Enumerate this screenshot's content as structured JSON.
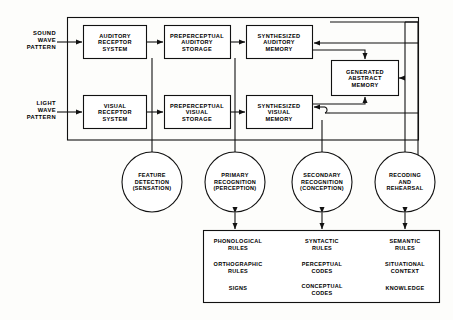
{
  "diagram": {
    "inputs": [
      {
        "name": "sound-wave-pattern",
        "label": "SOUND\nWAVE\nPATTERN"
      },
      {
        "name": "light-wave-pattern",
        "label": "LIGHT\nWAVE\nPATTERN"
      }
    ],
    "boxes": [
      {
        "name": "auditory-receptor-system",
        "label": "AUDITORY\nRECEPTOR\nSYSTEM"
      },
      {
        "name": "preperceptual-auditory-storage",
        "label": "PREPERCEPTUAL\nAUDITORY\nSTORAGE"
      },
      {
        "name": "synthesized-auditory-memory",
        "label": "SYNTHESIZED\nAUDITORY\nMEMORY"
      },
      {
        "name": "generated-abstract-memory",
        "label": "GENERATED\nABSTRACT\nMEMORY"
      },
      {
        "name": "visual-receptor-system",
        "label": "VISUAL\nRECEPTOR\nSYSTEM"
      },
      {
        "name": "preperceptual-visual-storage",
        "label": "PREPERCEPTUAL\nVISUAL\nSTORAGE"
      },
      {
        "name": "synthesized-visual-memory",
        "label": "SYNTHESIZED\nVISUAL\nMEMORY"
      }
    ],
    "processes": [
      {
        "name": "feature-detection",
        "label": "FEATURE\nDETECTION\n(SENSATION)"
      },
      {
        "name": "primary-recognition",
        "label": "PRIMARY\nRECOGNITION\n(PERCEPTION)"
      },
      {
        "name": "secondary-recognition",
        "label": "SECONDARY\nRECOGNITION\n(CONCEPTION)"
      },
      {
        "name": "recoding-and-rehearsal",
        "label": "RECODING\nAND\nREHEARSAL"
      }
    ],
    "knowledge_columns": [
      {
        "name": "phonological-column",
        "items": [
          "PHONOLOGICAL\nRULES",
          "ORTHOGRAPHIC\nRULES",
          "SIGNS"
        ]
      },
      {
        "name": "syntactic-column",
        "items": [
          "SYNTACTIC\nRULES",
          "PERCEPTUAL\nCODES",
          "CONCEPTUAL\nCODES"
        ]
      },
      {
        "name": "semantic-column",
        "items": [
          "SEMANTIC\nRULES",
          "SITUATIONAL\nCONTEXT",
          "KNOWLEDGE"
        ]
      }
    ],
    "colors": {
      "line": "#111111",
      "background": "#fdfdfb",
      "text": "#000000"
    }
  }
}
